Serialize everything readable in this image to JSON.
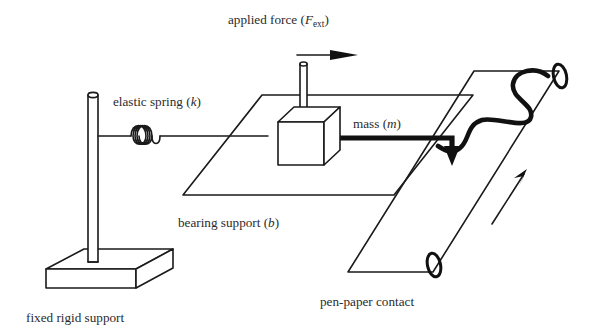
{
  "figure": {
    "background_color": "#ffffff",
    "ink_color": "#1a1a1a",
    "width": 595,
    "height": 335
  },
  "labels": {
    "applied_force": {
      "prefix": "applied force (",
      "symbol": "F",
      "subscript": "ext",
      "suffix": ")"
    },
    "elastic_spring": {
      "prefix": "elastic spring (",
      "symbol": "k",
      "suffix": ")"
    },
    "mass": {
      "prefix": "mass (",
      "symbol": "m",
      "suffix": ")"
    },
    "bearing_support": {
      "prefix": "bearing support (",
      "symbol": "b",
      "suffix": ")"
    },
    "pen_paper_contact": {
      "text": "pen-paper contact"
    },
    "fixed_rigid_support": {
      "text": "fixed rigid support"
    }
  },
  "parts": {
    "vertical_post": "vertical-post",
    "base_plate": "base-plate",
    "coil_spring": "coil-spring",
    "spring_link_rod": "spring-link-rod",
    "bearing_plane": "bearing-support-plane",
    "mass_block": "mass-block",
    "mass_rod": "mass-vertical-rod",
    "force_arrow": "applied-force-arrow",
    "pen_rod": "pen-rod",
    "pen_tip_arrow": "pen-tip-arrow",
    "paper_strip": "paper-strip",
    "roller_top": "paper-roller-top",
    "roller_bottom": "paper-roller-bottom",
    "pen_trace": "recorded-pen-trace",
    "paper_direction_arrow": "paper-feed-direction-arrow"
  },
  "spring": {
    "coil_count": 4
  }
}
